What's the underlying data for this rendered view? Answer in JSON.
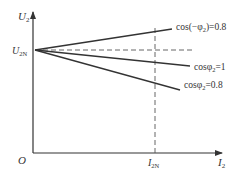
{
  "diagram": {
    "type": "transformer-external-characteristic",
    "axes": {
      "y_label": "U",
      "y_label_sub": "2",
      "x_label": "I",
      "x_label_sub": "2",
      "origin_label": "O"
    },
    "markers": {
      "u2n_label": "U",
      "u2n_sub": "2N",
      "i2n_label": "I",
      "i2n_sub": "2N"
    },
    "curves": [
      {
        "id": "leading",
        "label_prefix": "cos(−φ",
        "label_sub": "2",
        "label_suffix": ")=0.8",
        "trend": "rising"
      },
      {
        "id": "unity",
        "label_prefix": "cosφ",
        "label_sub": "2",
        "label_suffix": "=1",
        "trend": "slightly falling"
      },
      {
        "id": "lagging",
        "label_prefix": "cosφ",
        "label_sub": "2",
        "label_suffix": "=0.8",
        "trend": "falling"
      }
    ],
    "colors": {
      "line": "#333333",
      "dashed": "#555555",
      "background": "#ffffff"
    }
  }
}
